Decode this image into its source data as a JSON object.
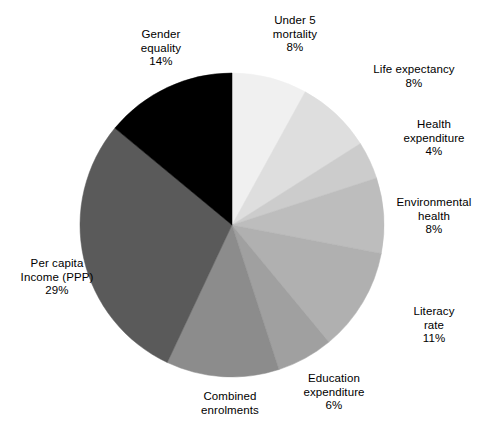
{
  "chart_data": {
    "type": "pie",
    "title": "",
    "subtitle": "",
    "xlabel": "",
    "ylabel": "",
    "legend_position": "none",
    "grid": false,
    "label_format": "name + percent",
    "start_angle_deg": 0,
    "direction": "clockwise",
    "units": "percent",
    "total": 100,
    "categories": [
      "Under 5 mortality",
      "Life expectancy",
      "Health expenditure",
      "Environmental health",
      "Literacy rate",
      "Education expenditure",
      "Combined enrolments",
      "Per capita Income (PPP)",
      "Gender equality"
    ],
    "values": [
      8,
      8,
      4,
      8,
      11,
      6,
      12,
      29,
      14
    ],
    "colors": [
      "#f0f0f0",
      "#dedede",
      "#cccccc",
      "#bdbdbd",
      "#b0b0b0",
      "#a0a0a0",
      "#8c8c8c",
      "#5a5a5a",
      "#000000"
    ],
    "slices": [
      {
        "name": "Under 5 mortality",
        "value": 8,
        "percent_label": "8%",
        "color": "#f0f0f0",
        "label_line1": "Under 5",
        "label_line2": "mortality"
      },
      {
        "name": "Life expectancy",
        "value": 8,
        "percent_label": "8%",
        "color": "#dedede",
        "label_line1": "Life expectancy",
        "label_line2": ""
      },
      {
        "name": "Health expenditure",
        "value": 4,
        "percent_label": "4%",
        "color": "#cccccc",
        "label_line1": "Health",
        "label_line2": "expenditure"
      },
      {
        "name": "Environmental health",
        "value": 8,
        "percent_label": "8%",
        "color": "#bdbdbd",
        "label_line1": "Environmental",
        "label_line2": "health"
      },
      {
        "name": "Literacy rate",
        "value": 11,
        "percent_label": "11%",
        "color": "#b0b0b0",
        "label_line1": "Literacy",
        "label_line2": "rate"
      },
      {
        "name": "Education expenditure",
        "value": 6,
        "percent_label": "6%",
        "color": "#a0a0a0",
        "label_line1": "Education",
        "label_line2": "expenditure"
      },
      {
        "name": "Combined enrolments",
        "value": 12,
        "percent_label": "",
        "color": "#8c8c8c",
        "label_line1": "Combined",
        "label_line2": "enrolments"
      },
      {
        "name": "Per capita Income (PPP)",
        "value": 29,
        "percent_label": "29%",
        "color": "#5a5a5a",
        "label_line1": "Per capita",
        "label_line2": "Income (PPP)"
      },
      {
        "name": "Gender equality",
        "value": 14,
        "percent_label": "14%",
        "color": "#000000",
        "label_line1": "Gender",
        "label_line2": "equality"
      }
    ]
  },
  "geometry": {
    "cx": 232,
    "cy": 225,
    "r": 152
  }
}
